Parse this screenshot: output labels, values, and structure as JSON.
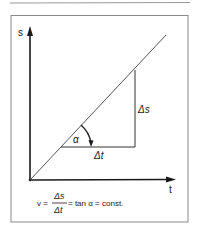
{
  "figure": {
    "axes": {
      "y_label": "s",
      "x_label": "t"
    },
    "line": {
      "description": "straight line through origin (constant velocity)"
    },
    "triangle": {
      "delta_s_label": "Δs",
      "delta_t_label": "Δt",
      "angle_label": "α"
    },
    "formula": {
      "lhs": "v =",
      "numerator": "Δs",
      "denominator": "Δt",
      "rhs": "= tan α = const."
    },
    "colors": {
      "ink": "#1a1a1a",
      "frame": "#8a8a8a",
      "background": "#ffffff"
    }
  }
}
